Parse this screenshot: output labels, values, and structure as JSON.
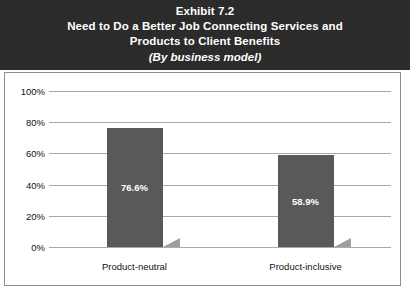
{
  "title": {
    "line1": "Exhibit 7.2",
    "line2": "Need to Do a Better Job Connecting Services and",
    "line3": "Products to Client Benefits",
    "subtitle": "(By business model)"
  },
  "colors": {
    "banner_background": "#2b2b2b",
    "banner_text": "#ffffff",
    "bar_fill": "#595959",
    "bar_shadow": "#9e9e9e",
    "gridline": "#a9a9a9",
    "frame_border": "#8d8d8d",
    "plot_background": "#ffffff",
    "axis_text": "#111111",
    "data_label_text": "#ffffff"
  },
  "chart_data": {
    "type": "bar",
    "title": "Need to Do a Better Job Connecting Services and Products to Client Benefits",
    "subtitle": "(By business model)",
    "categories": [
      "Product-neutral",
      "Product-inclusive"
    ],
    "values": [
      76.6,
      58.9
    ],
    "data_labels": [
      "76.6%",
      "58.9%"
    ],
    "xlabel": "",
    "ylabel": "",
    "ylim": [
      0,
      100
    ],
    "ytick_values": [
      0,
      20,
      40,
      60,
      80,
      100
    ],
    "ytick_labels": [
      "0%",
      "20%",
      "40%",
      "60%",
      "80%",
      "100%"
    ],
    "grid": true,
    "legend": "none",
    "series": [
      {
        "name": "Percent",
        "values": [
          76.6,
          58.9
        ]
      }
    ]
  }
}
